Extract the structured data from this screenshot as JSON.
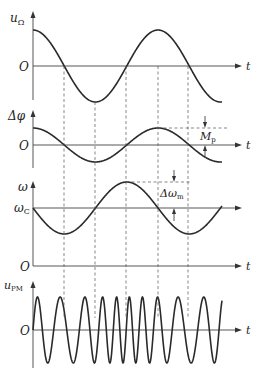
{
  "chart_data": {
    "type": "line",
    "title": "",
    "shared_x": {
      "label": "t",
      "period_px": 125,
      "start_x": 33,
      "end_x": 222
    },
    "guide_lines_x": [
      64,
      95,
      126,
      158,
      188
    ],
    "panels": [
      {
        "name": "modulating-signal",
        "ylabel": "u",
        "ylabel_sub": "Ω",
        "origin_label": "O",
        "xlabel": "t",
        "axis_y": 66,
        "amplitude_px": 36,
        "function": "cos",
        "phase": 0,
        "description": "u_Ω = U cos(Ωt)"
      },
      {
        "name": "phase-deviation",
        "ylabel": "Δφ",
        "ylabel_sub": "",
        "origin_label": "O",
        "xlabel": "t",
        "axis_y": 145,
        "amplitude_px": 17,
        "function": "cos",
        "phase": 0,
        "annotation": {
          "label": "M",
          "label_sub": "p",
          "meaning": "max phase deviation"
        },
        "description": "Δφ = Mp cos(Ωt)"
      },
      {
        "name": "angular-frequency",
        "ylabel": "ω",
        "ylabel_sub": "",
        "center_label": "ω",
        "center_label_sub": "C",
        "origin_label": "O",
        "xlabel": "t",
        "axis_y": 208,
        "zero_axis_y": 266,
        "amplitude_px": 26,
        "function": "-sin",
        "phase": 0,
        "annotation": {
          "label": "Δω",
          "label_sub": "m",
          "meaning": "max frequency deviation"
        },
        "description": "ω = ωc − Δωm sin(Ωt)"
      },
      {
        "name": "pm-signal",
        "ylabel": "u",
        "ylabel_sub": "PM",
        "origin_label": "O",
        "xlabel": "t",
        "axis_y": 330,
        "amplitude_px": 33,
        "carrier_cycles": 11,
        "modulation_index": 2.6,
        "description": "u_PM = U cos(ωc t + Mp cos Ωt)"
      }
    ]
  }
}
